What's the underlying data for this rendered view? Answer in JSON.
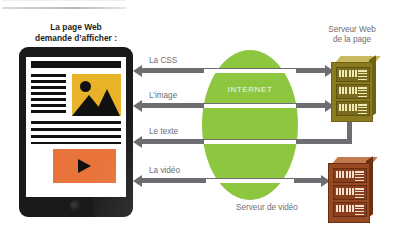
{
  "title_block": {
    "line1": "La page Web",
    "line2": "demande d’afficher :"
  },
  "internet": {
    "label": "INTERNET",
    "color": "#8dc63f"
  },
  "flows": [
    {
      "label": "La CSS",
      "target": "web-server"
    },
    {
      "label": "L’image",
      "target": "web-server"
    },
    {
      "label": "Le texte",
      "target": "web-server"
    },
    {
      "label": "La vidéo",
      "target": "video-server"
    }
  ],
  "servers": {
    "web": {
      "line1": "Serveur Web",
      "line2": "de la page",
      "color": "#8a7a20"
    },
    "video": {
      "label": "Serveur de vidéo",
      "color": "#9a4a22"
    }
  },
  "device": {
    "name": "tablet",
    "content": {
      "headline_bar": "title-bar",
      "image_placeholder": "image-thumbnail",
      "video_placeholder": "video-thumbnail",
      "text_lines": 10
    },
    "colors": {
      "bezel": "#1a1a1a",
      "image": "#e8b229",
      "video": "#e8743b"
    }
  },
  "palette": {
    "connector": "#6d6e71",
    "label_text": "#6d6e71",
    "heading_text": "#231f20",
    "background": "#ffffff"
  }
}
